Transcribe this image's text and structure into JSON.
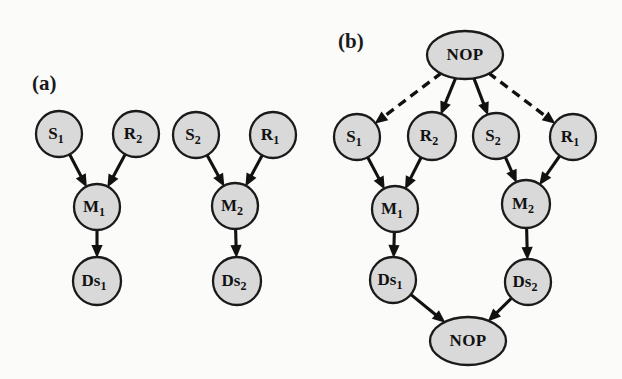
{
  "figure": {
    "background_color": "#fbfbfa",
    "node_fill": "#d9d9d9",
    "node_stroke": "#1a1a1a",
    "edge_color": "#111111",
    "panels": [
      {
        "id": "panel-a",
        "label": "(a)",
        "label_x": 32,
        "label_y": 90,
        "description": "Two independent task chains without NOP synchronization nodes",
        "nodes": [
          {
            "id": "a-s1",
            "text": "S",
            "sub": "1",
            "shape": "circle",
            "cx": 59,
            "cy": 134,
            "r": 23
          },
          {
            "id": "a-r2",
            "text": "R",
            "sub": "2",
            "shape": "circle",
            "cx": 136,
            "cy": 134,
            "r": 23
          },
          {
            "id": "a-m1",
            "text": "M",
            "sub": "1",
            "shape": "circle",
            "cx": 97,
            "cy": 207,
            "r": 23
          },
          {
            "id": "a-ds1",
            "text": "Ds",
            "sub": "1",
            "shape": "circle",
            "cx": 97,
            "cy": 281,
            "r": 24
          },
          {
            "id": "a-s2",
            "text": "S",
            "sub": "2",
            "shape": "circle",
            "cx": 196,
            "cy": 135,
            "r": 23
          },
          {
            "id": "a-r1",
            "text": "R",
            "sub": "1",
            "shape": "circle",
            "cx": 273,
            "cy": 135,
            "r": 23
          },
          {
            "id": "a-m2",
            "text": "M",
            "sub": "2",
            "shape": "circle",
            "cx": 235,
            "cy": 206,
            "r": 23
          },
          {
            "id": "a-ds2",
            "text": "Ds",
            "sub": "2",
            "shape": "circle",
            "cx": 237,
            "cy": 281,
            "r": 24
          }
        ],
        "edges": [
          {
            "from": "a-s1",
            "to": "a-m1",
            "style": "solid"
          },
          {
            "from": "a-r2",
            "to": "a-m1",
            "style": "solid"
          },
          {
            "from": "a-m1",
            "to": "a-ds1",
            "style": "solid"
          },
          {
            "from": "a-s2",
            "to": "a-m2",
            "style": "solid"
          },
          {
            "from": "a-r1",
            "to": "a-m2",
            "style": "solid"
          },
          {
            "from": "a-m2",
            "to": "a-ds2",
            "style": "solid"
          }
        ]
      },
      {
        "id": "panel-b",
        "label": "(b)",
        "label_x": 338,
        "label_y": 48,
        "description": "Same two task chains joined by a top NOP fork node and a bottom NOP join node",
        "nodes": [
          {
            "id": "b-nop-top",
            "text": "NOP",
            "sub": "",
            "shape": "ellipse",
            "cx": 465,
            "cy": 55,
            "rx": 38,
            "ry": 24
          },
          {
            "id": "b-s1",
            "text": "S",
            "sub": "1",
            "shape": "circle",
            "cx": 357,
            "cy": 137,
            "r": 23
          },
          {
            "id": "b-r2",
            "text": "R",
            "sub": "2",
            "shape": "circle",
            "cx": 432,
            "cy": 136,
            "r": 24
          },
          {
            "id": "b-s2",
            "text": "S",
            "sub": "2",
            "shape": "circle",
            "cx": 496,
            "cy": 136,
            "r": 23
          },
          {
            "id": "b-r1",
            "text": "R",
            "sub": "1",
            "shape": "circle",
            "cx": 573,
            "cy": 137,
            "r": 23
          },
          {
            "id": "b-m1",
            "text": "M",
            "sub": "1",
            "shape": "circle",
            "cx": 395,
            "cy": 209,
            "r": 23
          },
          {
            "id": "b-m2",
            "text": "M",
            "sub": "2",
            "shape": "circle",
            "cx": 526,
            "cy": 204,
            "r": 24
          },
          {
            "id": "b-ds1",
            "text": "Ds",
            "sub": "1",
            "shape": "circle",
            "cx": 393,
            "cy": 280,
            "r": 23
          },
          {
            "id": "b-ds2",
            "text": "Ds",
            "sub": "2",
            "shape": "circle",
            "cx": 528,
            "cy": 282,
            "r": 23
          },
          {
            "id": "b-nop-bottom",
            "text": "NOP",
            "sub": "",
            "shape": "ellipse",
            "cx": 468,
            "cy": 341,
            "rx": 38,
            "ry": 24
          }
        ],
        "edges": [
          {
            "from": "b-nop-top",
            "to": "b-s1",
            "style": "dashed"
          },
          {
            "from": "b-nop-top",
            "to": "b-r2",
            "style": "solid"
          },
          {
            "from": "b-nop-top",
            "to": "b-s2",
            "style": "solid"
          },
          {
            "from": "b-nop-top",
            "to": "b-r1",
            "style": "dashed"
          },
          {
            "from": "b-s1",
            "to": "b-m1",
            "style": "solid"
          },
          {
            "from": "b-r2",
            "to": "b-m1",
            "style": "solid"
          },
          {
            "from": "b-s2",
            "to": "b-m2",
            "style": "solid"
          },
          {
            "from": "b-r1",
            "to": "b-m2",
            "style": "solid"
          },
          {
            "from": "b-m1",
            "to": "b-ds1",
            "style": "solid"
          },
          {
            "from": "b-m2",
            "to": "b-ds2",
            "style": "solid"
          },
          {
            "from": "b-ds1",
            "to": "b-nop-bottom",
            "style": "solid"
          },
          {
            "from": "b-ds2",
            "to": "b-nop-bottom",
            "style": "solid"
          }
        ]
      }
    ]
  }
}
